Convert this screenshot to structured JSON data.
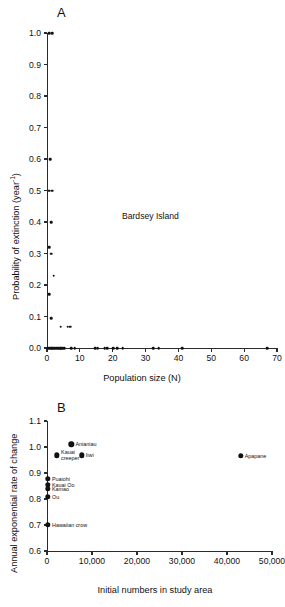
{
  "figure": {
    "panels": [
      {
        "letter": "A",
        "annotation": "Bardsey Island",
        "xlabel": "Population size (N)",
        "ylabel_main": "Probability of extinction (year",
        "ylabel_sup": "-1",
        "ylabel_tail": ")"
      },
      {
        "letter": "B",
        "xlabel": "Initial numbers in study area",
        "ylabel": "Annual exponential rate of change"
      }
    ]
  },
  "chart_data": [
    {
      "type": "scatter",
      "panel": "A",
      "title": "",
      "annotations": [
        "Bardsey Island"
      ],
      "xlabel": "Population size (N)",
      "ylabel": "Probability of extinction (year^-1)",
      "xlim": [
        0,
        70
      ],
      "ylim": [
        0.0,
        1.0
      ],
      "xticks": [
        0,
        10,
        20,
        30,
        40,
        50,
        60,
        70
      ],
      "xticklabels": [
        "0",
        "10",
        "20",
        "30",
        "40",
        "50",
        "60",
        "70"
      ],
      "yticks": [
        0.0,
        0.1,
        0.2,
        0.3,
        0.4,
        0.5,
        0.6,
        0.7,
        0.8,
        0.9,
        1.0
      ],
      "yticklabels": [
        "0.0",
        "0.1",
        "0.2",
        "0.3",
        "0.4",
        "0.5",
        "0.6",
        "0.7",
        "0.8",
        "0.9",
        "1.0"
      ],
      "grid": false,
      "legend": "none",
      "marker": "filled-circle",
      "points": [
        [
          0.6,
          1.0
        ],
        [
          1.5,
          1.0
        ],
        [
          1.0,
          0.6
        ],
        [
          0.6,
          0.5
        ],
        [
          1.5,
          0.5
        ],
        [
          1.2,
          0.4
        ],
        [
          0.6,
          0.32
        ],
        [
          1.2,
          0.3
        ],
        [
          2.0,
          0.23
        ],
        [
          0.6,
          0.17
        ],
        [
          1.2,
          0.095
        ],
        [
          4.2,
          0.068
        ],
        [
          6.3,
          0.068
        ],
        [
          7.0,
          0.068
        ],
        [
          0.4,
          0.0
        ],
        [
          0.8,
          0.0
        ],
        [
          1.2,
          0.0
        ],
        [
          1.6,
          0.0
        ],
        [
          2.0,
          0.0
        ],
        [
          2.4,
          0.0
        ],
        [
          2.8,
          0.0
        ],
        [
          3.2,
          0.0
        ],
        [
          3.6,
          0.0
        ],
        [
          4.0,
          0.0
        ],
        [
          4.4,
          0.0
        ],
        [
          4.8,
          0.0
        ],
        [
          5.2,
          0.0
        ],
        [
          7.4,
          0.0
        ],
        [
          8.4,
          0.0
        ],
        [
          14.6,
          0.0
        ],
        [
          15.4,
          0.0
        ],
        [
          17.6,
          0.0
        ],
        [
          18.4,
          0.0
        ],
        [
          20.2,
          0.0
        ],
        [
          21.4,
          0.0
        ],
        [
          23.0,
          0.0
        ],
        [
          32.3,
          0.0
        ],
        [
          34.0,
          0.0
        ],
        [
          41.2,
          0.0
        ],
        [
          67.0,
          0.0
        ]
      ]
    },
    {
      "type": "scatter",
      "panel": "B",
      "title": "",
      "xlabel": "Initial numbers in study area",
      "ylabel": "Annual exponential rate of change",
      "xlim": [
        0,
        50000
      ],
      "ylim": [
        0.6,
        1.1
      ],
      "xticks": [
        0,
        10000,
        20000,
        30000,
        40000,
        50000
      ],
      "xticklabels": [
        "0",
        "10,000",
        "20,000",
        "30,000",
        "40,000",
        "50,000"
      ],
      "yticks": [
        0.6,
        0.7,
        0.8,
        0.9,
        1.0,
        1.1
      ],
      "yticklabels": [
        "0.6",
        "0.7",
        "0.8",
        "0.9",
        "1.0",
        "1.1"
      ],
      "grid": false,
      "legend": "none",
      "marker": "filled-circle",
      "points": [
        {
          "label": "Anianiau",
          "x": 5400,
          "y": 1.01,
          "label_pos": "right"
        },
        {
          "label": "Kauai creeper",
          "x": 2200,
          "y": 0.968,
          "label_pos": "right-wrap"
        },
        {
          "label": "Iiwi",
          "x": 7700,
          "y": 0.968,
          "label_pos": "right"
        },
        {
          "label": "Apapane",
          "x": 43000,
          "y": 0.967,
          "label_pos": "right"
        },
        {
          "label": "Puaiohi",
          "x": 180,
          "y": 0.878,
          "label_pos": "right"
        },
        {
          "label": "Kauai Oo",
          "x": 180,
          "y": 0.855,
          "label_pos": "right"
        },
        {
          "label": "Kamao",
          "x": 180,
          "y": 0.84,
          "label_pos": "right"
        },
        {
          "label": "Ou",
          "x": 180,
          "y": 0.808,
          "label_pos": "right"
        },
        {
          "label": "Hawaiian crow",
          "x": 180,
          "y": 0.7,
          "label_pos": "right"
        }
      ]
    }
  ]
}
